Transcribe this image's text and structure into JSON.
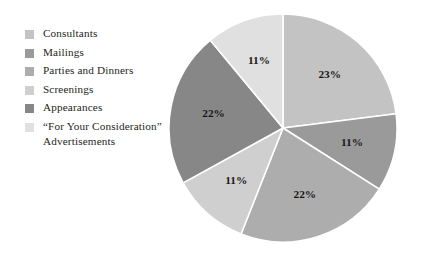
{
  "chart_data": {
    "type": "pie",
    "title": "",
    "subtitle": "",
    "xlabel": "",
    "ylabel": "",
    "grid": false,
    "legend_position": "left",
    "start_angle_deg": 0,
    "direction": "clockwise",
    "categories": [
      "Consultants",
      "Mailings",
      "Parties and Dinners",
      "Screenings",
      "Appearances",
      "“For Your Consideration” Advertisements"
    ],
    "values": [
      23,
      11,
      22,
      11,
      22,
      11
    ],
    "value_labels": [
      "23%",
      "11%",
      "22%",
      "11%",
      "22%",
      "11%"
    ],
    "colors": [
      "#c3c3c3",
      "#9a9a9a",
      "#adadad",
      "#cfcfcf",
      "#878787",
      "#e0e0e0"
    ],
    "slices": [
      {
        "label": "Consultants",
        "value": 23,
        "value_label": "23%",
        "color": "#c3c3c3"
      },
      {
        "label": "Mailings",
        "value": 11,
        "value_label": "11%",
        "color": "#9a9a9a"
      },
      {
        "label": "Parties and Dinners",
        "value": 22,
        "value_label": "22%",
        "color": "#adadad"
      },
      {
        "label": "Screenings",
        "value": 11,
        "value_label": "11%",
        "color": "#cfcfcf"
      },
      {
        "label": "Appearances",
        "value": 22,
        "value_label": "22%",
        "color": "#878787"
      },
      {
        "label": "“For Your Consideration” Advertisements",
        "value": 11,
        "value_label": "11%",
        "color": "#e0e0e0"
      }
    ]
  },
  "legend": {
    "items": [
      {
        "label": "Consultants",
        "color": "#c3c3c3"
      },
      {
        "label": "Mailings",
        "color": "#9a9a9a"
      },
      {
        "label": "Parties and Dinners",
        "color": "#adadad"
      },
      {
        "label": "Screenings",
        "color": "#cfcfcf"
      },
      {
        "label": "Appearances",
        "color": "#878787"
      },
      {
        "label": "“For Your Consideration”\nAdvertisements",
        "color": "#e0e0e0"
      }
    ]
  },
  "style": {
    "background": "#ffffff",
    "slice_separator": "#ffffff",
    "text_color": "#231f20"
  }
}
